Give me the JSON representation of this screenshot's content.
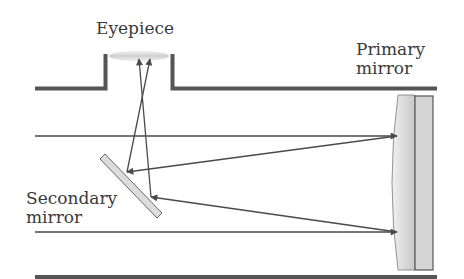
{
  "labels": {
    "eyepiece": "Eyepiece",
    "primary_mirror_line1": "Primary",
    "primary_mirror_line2": "mirror",
    "secondary_mirror_line1": "Secondary",
    "secondary_mirror_line2": "mirror"
  },
  "colors": {
    "tube": "#555555",
    "ray": "#4a4a4a",
    "mirror_fill": "#dcdcdc",
    "mirror_stroke": "#555555",
    "text": "#3a3a3a"
  }
}
